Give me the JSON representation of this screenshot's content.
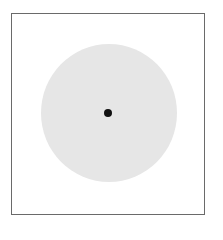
{
  "figure": {
    "frame": {
      "shape": "square",
      "border_color": "#6a6a6a"
    },
    "disc": {
      "shape": "circle",
      "fill_color": "#e6e6e6"
    },
    "center_point": {
      "shape": "dot",
      "fill_color": "#111111"
    }
  }
}
